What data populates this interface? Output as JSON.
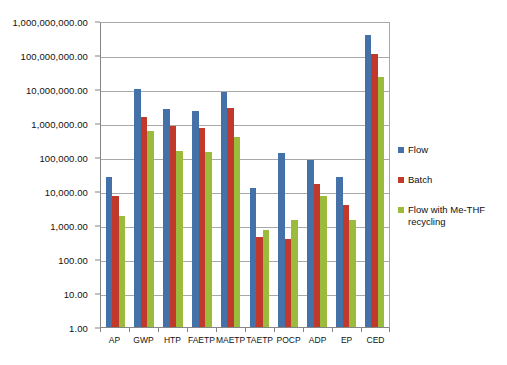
{
  "chart_data": {
    "type": "bar",
    "title": "",
    "subtitle": "",
    "xlabel": "",
    "ylabel": "",
    "yscale": "log",
    "ylim": [
      1,
      1000000000
    ],
    "grid": true,
    "legend_position": "right",
    "categories": [
      "AP",
      "GWP",
      "HTP",
      "FAETP",
      "MAETP",
      "TAETP",
      "POCP",
      "ADP",
      "EP",
      "CED"
    ],
    "ytick_labels": [
      "1,000,000,000.00",
      "100,000,000.00",
      "10,000,000.00",
      "1,000,000.00",
      "100,000.00",
      "10,000.00",
      "1,000.00",
      "100.00",
      "10.00",
      "1.00"
    ],
    "ytick_values": [
      1000000000,
      100000000,
      10000000,
      1000000,
      100000,
      10000,
      1000,
      100,
      10,
      1
    ],
    "series": [
      {
        "name": "Flow",
        "color": "#4472a8",
        "values": [
          26000,
          10000000,
          2500000,
          2200000,
          8000000,
          12000,
          130000,
          80000,
          25000,
          400000000
        ]
      },
      {
        "name": "Batch",
        "color": "#c0392b",
        "values": [
          7000,
          1500000,
          800000,
          700000,
          2800000,
          450,
          380,
          16000,
          3800,
          110000000
        ]
      },
      {
        "name": "Flow with Me-THF recycling",
        "color": "#9bbb3c",
        "values": [
          1800,
          600000,
          150000,
          140000,
          400000,
          700,
          1400,
          7000,
          1400,
          22000000
        ]
      }
    ]
  },
  "legend": {
    "entries": [
      {
        "label": "Flow",
        "color": "#4472a8"
      },
      {
        "label": "Batch",
        "color": "#c0392b"
      },
      {
        "label": "Flow with Me-THF recycling",
        "color": "#9bbb3c"
      }
    ]
  },
  "colors": {
    "series_flow": "#4472a8",
    "series_batch": "#c0392b",
    "series_flow_recycling": "#9bbb3c",
    "gridline": "#a9a9a9",
    "axis": "#868686",
    "text": "#111111",
    "background": "#ffffff"
  }
}
